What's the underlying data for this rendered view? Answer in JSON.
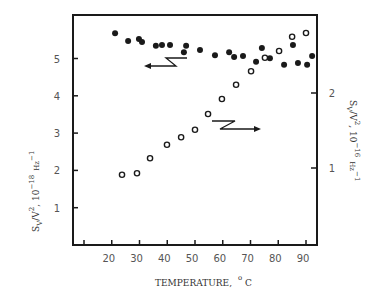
{
  "chart_data": {
    "type": "scatter",
    "title": "",
    "xlabel": "TEMPERATURE, °C",
    "xlabel_main": "TEMPERATURE,",
    "xlabel_unit_sup": "o",
    "xlabel_unit": "C",
    "ylabel_left": "S_V/V^2, 10^-18 Hz^-1",
    "ylabel_right": "S_V/V^2, 10^-16 Hz^-1",
    "xlim": [
      6,
      94
    ],
    "ylim_left": [
      0,
      6.1
    ],
    "ylim_right": [
      0,
      3.05
    ],
    "x_ticks": [
      10,
      20,
      30,
      40,
      50,
      60,
      70,
      80,
      90
    ],
    "x_tick_labels": [
      "",
      "20",
      "30",
      "40",
      "50",
      "60",
      "70",
      "80",
      "90"
    ],
    "y_left_ticks": [
      1,
      2,
      3,
      4,
      5
    ],
    "y_left_tick_labels": [
      "1",
      "2",
      "3",
      "4",
      "5"
    ],
    "y_right_ticks": [
      1,
      2
    ],
    "y_right_tick_labels": [
      "1",
      "2"
    ],
    "grid": false,
    "legend": "none (arrows indicate axis for each series)",
    "series": [
      {
        "name": "filled circles (left axis, 10^-18 Hz^-1)",
        "marker": "filled-circle",
        "axis": "left",
        "x": [
          21.2,
          25.9,
          29.8,
          30.9,
          35.9,
          38.1,
          41.0,
          46.0,
          46.8,
          51.8,
          57.2,
          62.3,
          64.1,
          67.3,
          72.0,
          74.1,
          77.0,
          82.1,
          85.3,
          87.1,
          90.4,
          92.2
        ],
        "y": [
          5.68,
          5.47,
          5.52,
          5.44,
          5.34,
          5.36,
          5.36,
          5.17,
          5.34,
          5.23,
          5.09,
          5.17,
          5.04,
          5.07,
          4.91,
          5.28,
          5.01,
          4.83,
          5.36,
          4.88,
          4.83,
          5.07
        ]
      },
      {
        "name": "open circles (right axis, 10^-16 Hz^-1)",
        "marker": "open-circle",
        "axis": "right",
        "x": [
          23.7,
          29.1,
          33.8,
          39.9,
          45.0,
          50.0,
          54.7,
          59.7,
          64.8,
          70.2,
          75.2,
          80.3,
          85.0,
          90.0
        ],
        "y": [
          0.91,
          0.93,
          1.13,
          1.31,
          1.41,
          1.51,
          1.72,
          1.92,
          2.11,
          2.29,
          2.47,
          2.56,
          2.75,
          2.8
        ]
      }
    ],
    "annotations": [
      {
        "type": "arrow",
        "direction": "left",
        "meaning": "filled circles refer to left axis"
      },
      {
        "type": "arrow",
        "direction": "right",
        "meaning": "open circles refer to right axis"
      }
    ]
  },
  "colors": {
    "ink": "#1a1a1a",
    "label": "#555555",
    "background": "#ffffff"
  }
}
